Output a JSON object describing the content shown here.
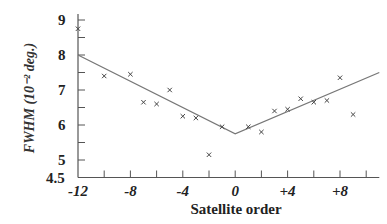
{
  "chart_data": {
    "type": "scatter",
    "title": "",
    "xlabel": "Satellite order",
    "ylabel": "FWHM (10⁻² deg.)",
    "xlim": [
      -12,
      11
    ],
    "ylim": [
      4.5,
      9.3
    ],
    "x_tick_labels": [
      {
        "value": -12,
        "label": "-12"
      },
      {
        "value": -8,
        "label": "-8"
      },
      {
        "value": -4,
        "label": "-4"
      },
      {
        "value": 0,
        "label": "0"
      },
      {
        "value": 4,
        "label": "+4"
      },
      {
        "value": 8,
        "label": "+8"
      }
    ],
    "x_minor_ticks": [
      -10,
      -8,
      -6,
      -4,
      -2,
      0,
      2,
      4,
      6,
      8,
      10
    ],
    "y_tick_labels": [
      {
        "value": 9,
        "label": "9"
      },
      {
        "value": 8,
        "label": "8"
      },
      {
        "value": 7,
        "label": "7"
      },
      {
        "value": 6,
        "label": "6"
      },
      {
        "value": 5,
        "label": "5"
      },
      {
        "value": 4.5,
        "label": "4.5"
      }
    ],
    "y_minor_ticks": [
      5,
      5.5,
      6,
      6.5,
      7,
      7.5,
      8,
      8.5,
      9
    ],
    "grid": false,
    "legend": null,
    "series": [
      {
        "name": "Measured FWHM",
        "marker": "x",
        "points": [
          {
            "x": -12,
            "y": 8.75
          },
          {
            "x": -10,
            "y": 7.4
          },
          {
            "x": -8,
            "y": 7.45
          },
          {
            "x": -7,
            "y": 6.65
          },
          {
            "x": -6,
            "y": 6.6
          },
          {
            "x": -5,
            "y": 7.0
          },
          {
            "x": -4,
            "y": 6.25
          },
          {
            "x": -3,
            "y": 6.2
          },
          {
            "x": -2,
            "y": 5.15
          },
          {
            "x": -1,
            "y": 5.95
          },
          {
            "x": 1,
            "y": 5.95
          },
          {
            "x": 2,
            "y": 5.8
          },
          {
            "x": 3,
            "y": 6.4
          },
          {
            "x": 4,
            "y": 6.45
          },
          {
            "x": 5,
            "y": 6.75
          },
          {
            "x": 6,
            "y": 6.65
          },
          {
            "x": 7,
            "y": 6.7
          },
          {
            "x": 8,
            "y": 7.35
          },
          {
            "x": 9,
            "y": 6.3
          }
        ]
      },
      {
        "name": "Fit line",
        "type": "line",
        "points": [
          {
            "x": -12,
            "y": 8.0
          },
          {
            "x": 0,
            "y": 5.75
          },
          {
            "x": 11,
            "y": 7.5
          }
        ]
      }
    ]
  },
  "colors": {
    "axis": "#555555",
    "line": "#777777",
    "marker": "#444444",
    "text": "#222222"
  }
}
